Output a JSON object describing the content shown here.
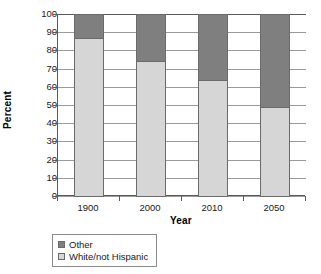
{
  "chart_data": {
    "type": "bar",
    "subtype": "stacked-100-percent",
    "title": "",
    "xlabel": "Year",
    "ylabel": "Percent",
    "categories": [
      "1900",
      "2000",
      "2010",
      "2050"
    ],
    "ylim": [
      0,
      100
    ],
    "ytick_step": 10,
    "yticks": [
      "100",
      "90",
      "80",
      "70",
      "60",
      "50",
      "40",
      "30",
      "20",
      "10",
      "0"
    ],
    "grid": true,
    "legend_position": "below-left",
    "series": [
      {
        "name": "Other",
        "color": "#7f7f7f",
        "values": [
          13,
          26,
          36,
          51
        ]
      },
      {
        "name": "White/not Hispanic",
        "color": "#d6d6d6",
        "values": [
          87,
          74,
          64,
          49
        ]
      }
    ],
    "stack_order_bottom_to_top": [
      "White/not Hispanic",
      "Other"
    ]
  },
  "legend": {
    "items": [
      {
        "label": "Other",
        "color": "#7f7f7f"
      },
      {
        "label": "White/not Hispanic",
        "color": "#d6d6d6"
      }
    ]
  },
  "axes": {
    "y_title": "Percent",
    "x_title": "Year"
  }
}
